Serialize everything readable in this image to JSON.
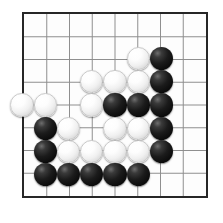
{
  "board": {
    "name": "go-board",
    "size": 9,
    "cols": 9,
    "rows": 9,
    "origin_x": 22,
    "origin_y": 12,
    "spacing": 23.25,
    "stone_radius": 11.6,
    "line_color": "#8c8c8c",
    "border_color": "#262626",
    "background_color": "#fdfdfd",
    "page_background": "#ffffff",
    "black_color": "#0d0d0d",
    "white_color": "#f4f4f4",
    "star_points": [],
    "stones": [
      {
        "color": "white",
        "col": 5,
        "row": 2
      },
      {
        "color": "black",
        "col": 6,
        "row": 2
      },
      {
        "color": "white",
        "col": 3,
        "row": 3
      },
      {
        "color": "white",
        "col": 4,
        "row": 3
      },
      {
        "color": "white",
        "col": 5,
        "row": 3
      },
      {
        "color": "black",
        "col": 6,
        "row": 3
      },
      {
        "color": "white",
        "col": 0,
        "row": 4
      },
      {
        "color": "white",
        "col": 1,
        "row": 4
      },
      {
        "color": "white",
        "col": 3,
        "row": 4
      },
      {
        "color": "black",
        "col": 4,
        "row": 4
      },
      {
        "color": "black",
        "col": 5,
        "row": 4
      },
      {
        "color": "black",
        "col": 6,
        "row": 4
      },
      {
        "color": "black",
        "col": 1,
        "row": 5
      },
      {
        "color": "white",
        "col": 2,
        "row": 5
      },
      {
        "color": "white",
        "col": 4,
        "row": 5
      },
      {
        "color": "white",
        "col": 5,
        "row": 5
      },
      {
        "color": "black",
        "col": 6,
        "row": 5
      },
      {
        "color": "black",
        "col": 1,
        "row": 6
      },
      {
        "color": "white",
        "col": 2,
        "row": 6
      },
      {
        "color": "white",
        "col": 3,
        "row": 6
      },
      {
        "color": "white",
        "col": 4,
        "row": 6
      },
      {
        "color": "white",
        "col": 5,
        "row": 6
      },
      {
        "color": "black",
        "col": 6,
        "row": 6
      },
      {
        "color": "black",
        "col": 1,
        "row": 7
      },
      {
        "color": "black",
        "col": 2,
        "row": 7
      },
      {
        "color": "black",
        "col": 3,
        "row": 7
      },
      {
        "color": "black",
        "col": 4,
        "row": 7
      },
      {
        "color": "black",
        "col": 5,
        "row": 7
      }
    ]
  }
}
